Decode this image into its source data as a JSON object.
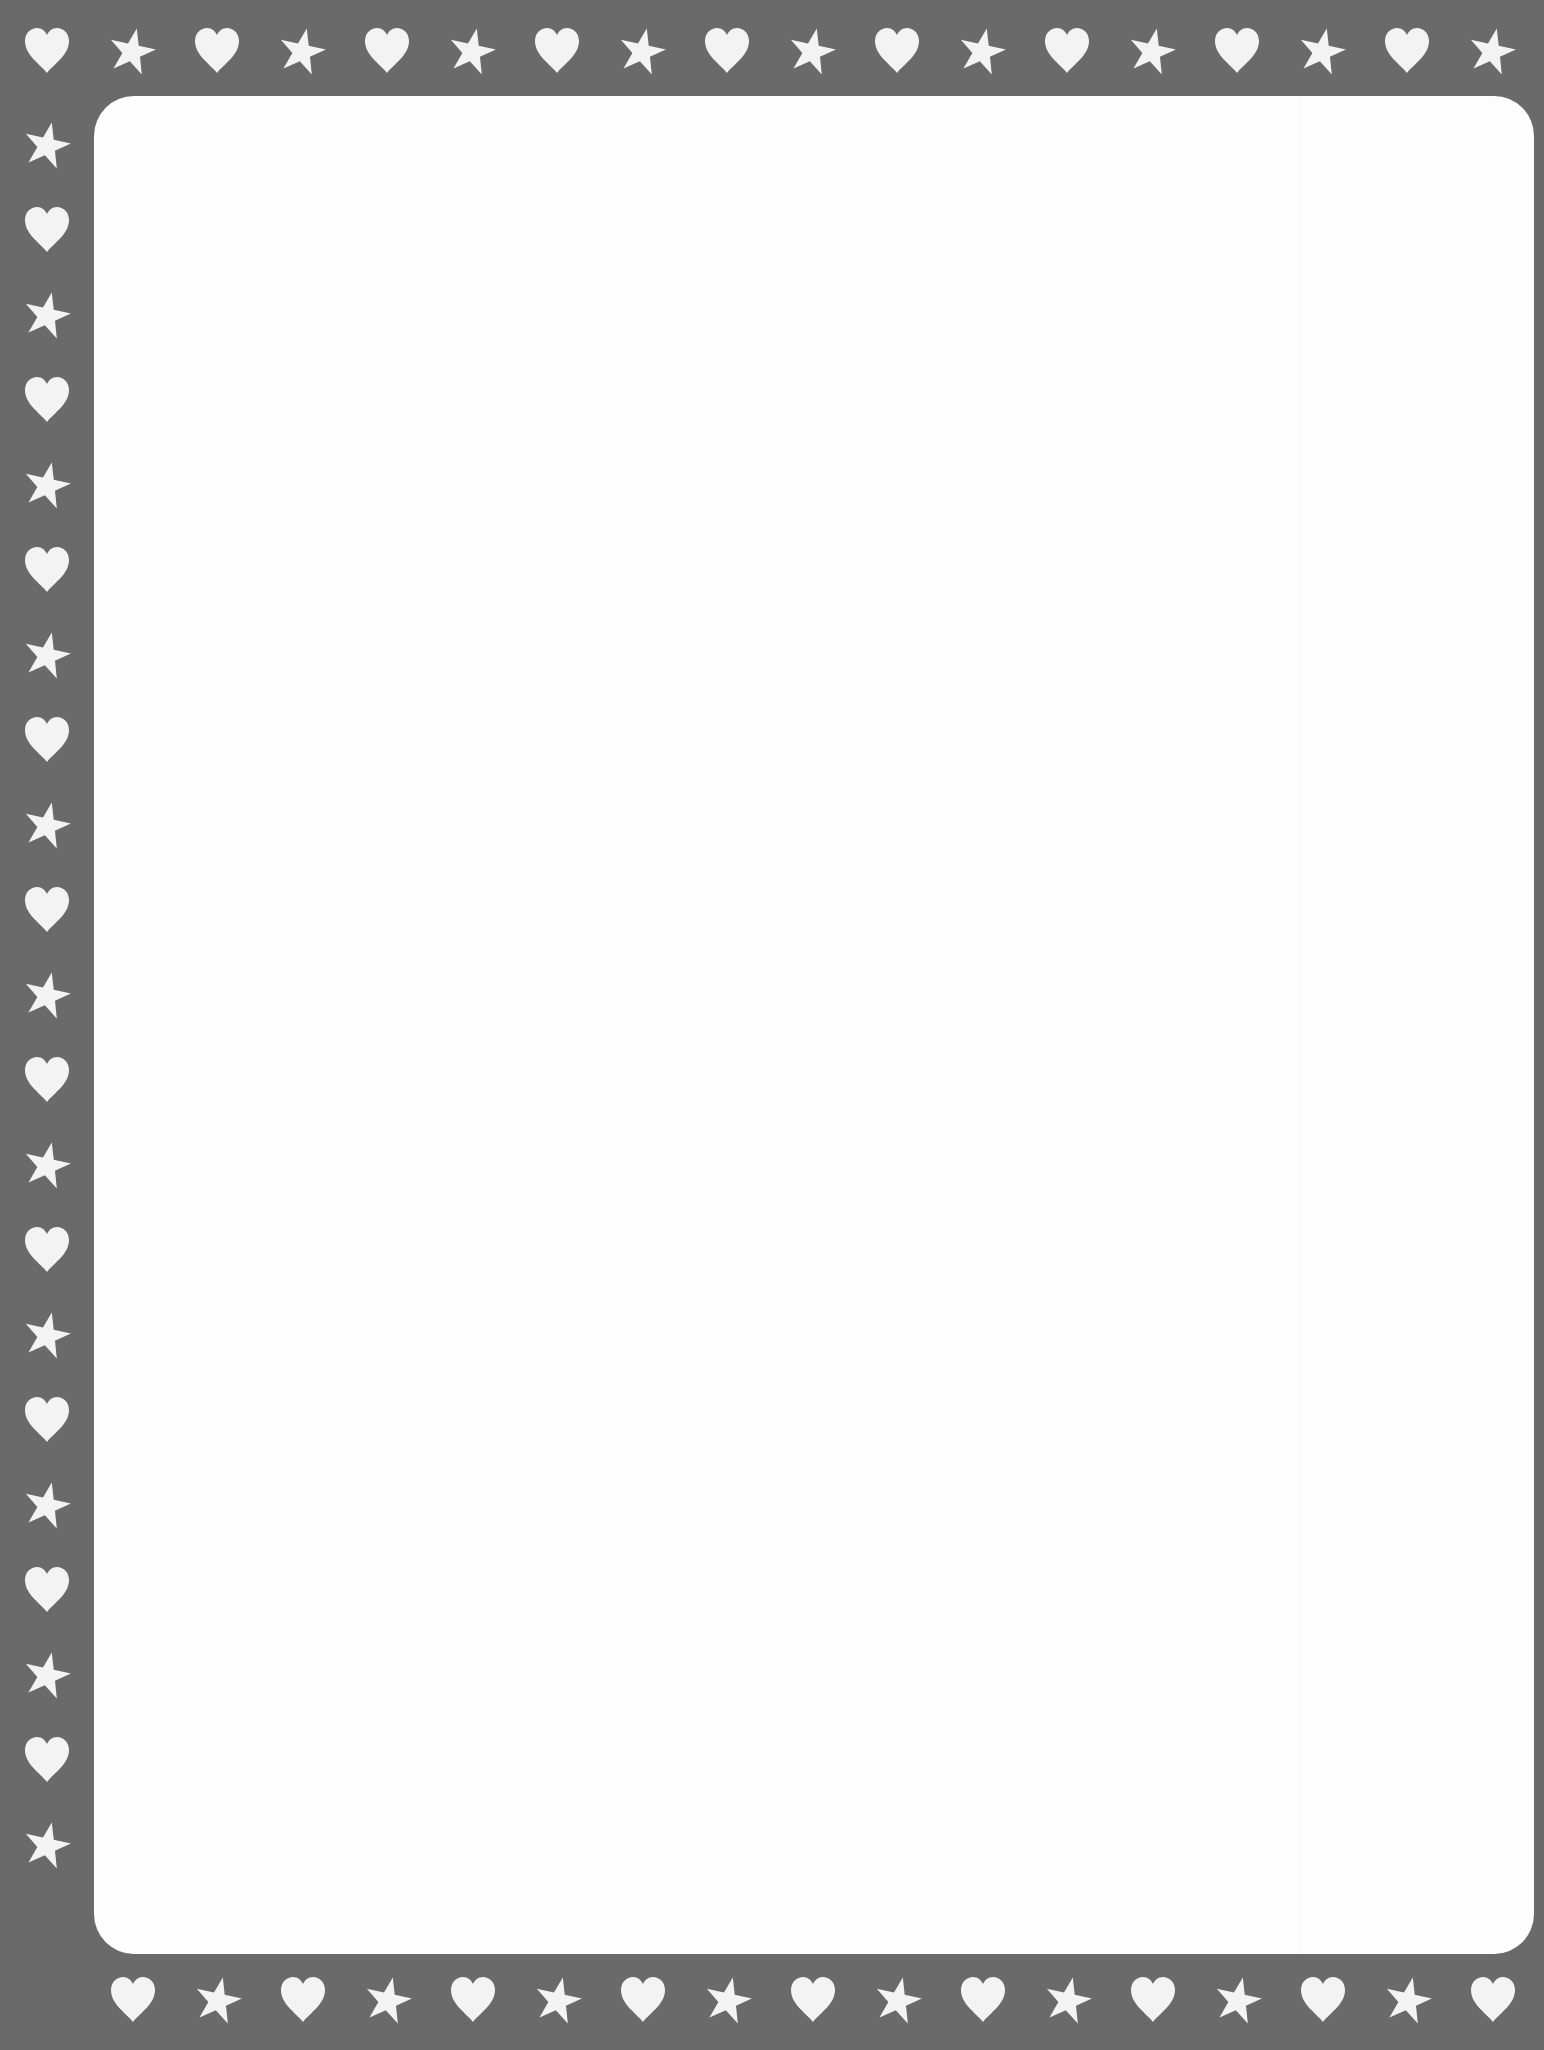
{
  "page": {
    "kind": "stationery-border",
    "colors": {
      "border": "#6a6a6a",
      "panel": "#fdfdfd",
      "icon": "#f3f3f3"
    }
  },
  "border": {
    "top_row": [
      "heart",
      "star",
      "heart",
      "star",
      "heart",
      "star",
      "heart",
      "star",
      "heart",
      "star",
      "heart",
      "star",
      "heart",
      "star",
      "heart",
      "star",
      "heart",
      "star"
    ],
    "left_column": [
      "star",
      "heart",
      "star",
      "heart",
      "star",
      "heart",
      "star",
      "heart",
      "star",
      "heart",
      "star",
      "heart",
      "star",
      "heart",
      "star",
      "heart",
      "star",
      "heart",
      "star",
      "heart",
      "star"
    ],
    "bottom_row": [
      "heart",
      "star",
      "heart",
      "star",
      "heart",
      "star",
      "heart",
      "star",
      "heart",
      "star",
      "heart",
      "star",
      "heart",
      "star",
      "heart",
      "star",
      "heart"
    ]
  },
  "content": {
    "text": ""
  }
}
